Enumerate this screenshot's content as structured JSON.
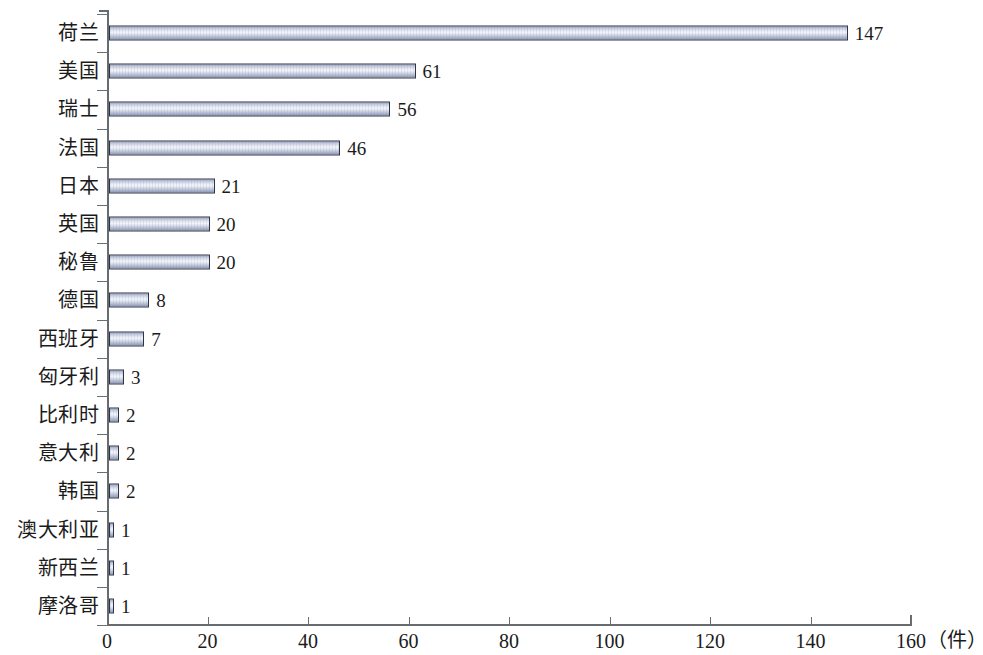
{
  "chart_data": {
    "type": "bar",
    "orientation": "horizontal",
    "title": "",
    "xlabel": "（件）",
    "ylabel": "",
    "xlim": [
      0,
      160
    ],
    "xticks": [
      0,
      20,
      40,
      60,
      80,
      100,
      120,
      140,
      160
    ],
    "grid": false,
    "legend": null,
    "categories": [
      "荷兰",
      "美国",
      "瑞士",
      "法国",
      "日本",
      "英国",
      "秘鲁",
      "德国",
      "西班牙",
      "匈牙利",
      "比利时",
      "意大利",
      "韩国",
      "澳大利亚",
      "新西兰",
      "摩洛哥"
    ],
    "values": [
      147,
      61,
      56,
      46,
      21,
      20,
      20,
      8,
      7,
      3,
      2,
      2,
      2,
      1,
      1,
      1
    ],
    "value_labels": [
      "147",
      "61",
      "56",
      "46",
      "21",
      "20",
      "20",
      "8",
      "7",
      "3",
      "2",
      "2",
      "2",
      "1",
      "1",
      "1"
    ],
    "xtick_labels": [
      "0",
      "20",
      "40",
      "60",
      "80",
      "100",
      "120",
      "140",
      "160"
    ],
    "colors": {
      "bar_border": "#2e3346",
      "bar_fill_light": "#f3f5fa",
      "bar_fill_mid": "#c3cadd",
      "bar_fill_dark": "#8e98b6",
      "axis": "#666b70",
      "text": "#1b1b1b",
      "background": "#ffffff"
    }
  }
}
